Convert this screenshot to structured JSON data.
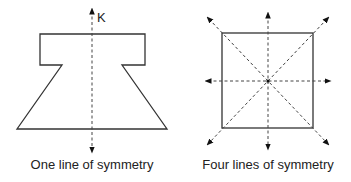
{
  "figures": [
    {
      "id": "left",
      "shape": "symmetric T-trapezoid",
      "axis_label": "K",
      "caption": "One line of symmetry",
      "lines_of_symmetry": 1
    },
    {
      "id": "right",
      "shape": "square",
      "caption": "Four lines of symmetry",
      "lines_of_symmetry": 4
    }
  ],
  "colors": {
    "stroke": "#333333",
    "dash": "#444444",
    "background": "#ffffff"
  }
}
